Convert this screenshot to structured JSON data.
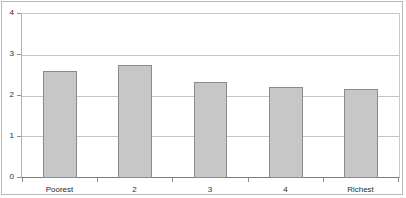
{
  "chart_data": {
    "type": "bar",
    "title": "",
    "subtitle": "",
    "xlabel": "",
    "ylabel": "",
    "categories": [
      "Poorest",
      "2",
      "3",
      "4",
      "Richest"
    ],
    "values": [
      2.62,
      2.75,
      2.35,
      2.21,
      2.16
    ],
    "series": [
      {
        "name": "",
        "values": [
          2.62,
          2.75,
          2.35,
          2.21,
          2.16
        ]
      }
    ],
    "ylim": [
      0,
      4
    ],
    "xlim": [
      0,
      5
    ],
    "y_ticks": [
      0,
      1,
      2,
      3,
      4
    ],
    "y_tick_labels": [
      "0",
      "1",
      "2",
      "3",
      "4"
    ],
    "x_tick_labels": [
      "Poorest",
      "2",
      "3",
      "4",
      "Richest"
    ],
    "grid": true,
    "grid_axis": "y",
    "legend": false,
    "legend_position": "none",
    "annotations": [],
    "colors": {
      "bar_fill": "#c7c7c7",
      "bar_stroke": "#8b8b8b",
      "gridline": "#c3c3c3",
      "axis": "#7d7d7d",
      "text": "#2b2b2b",
      "figure_border": "#b9b9b9",
      "background": "#ffffff"
    }
  }
}
